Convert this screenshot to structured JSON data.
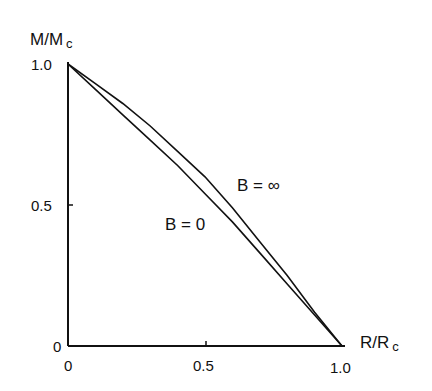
{
  "chart_data": {
    "type": "line",
    "title": "",
    "xlabel": "R/R",
    "xlabel_subscript": "c",
    "ylabel": "M/M",
    "ylabel_subscript": "c",
    "xlim": [
      0,
      1.0
    ],
    "ylim": [
      0,
      1.0
    ],
    "x_ticks": [
      "0",
      "0.5",
      "1.0"
    ],
    "y_ticks": [
      "0",
      "0.5",
      "1.0"
    ],
    "grid": false,
    "legend": "inline annotations",
    "series": [
      {
        "name": "B = ∞",
        "x": [
          0,
          0.1,
          0.2,
          0.3,
          0.4,
          0.5,
          0.6,
          0.7,
          0.8,
          0.9,
          1.0
        ],
        "y": [
          1.0,
          0.93,
          0.86,
          0.78,
          0.69,
          0.6,
          0.49,
          0.37,
          0.25,
          0.12,
          0
        ]
      },
      {
        "name": "B = 0",
        "x": [
          0,
          0.1,
          0.2,
          0.3,
          0.4,
          0.5,
          0.6,
          0.7,
          0.8,
          0.9,
          1.0
        ],
        "y": [
          1.0,
          0.91,
          0.82,
          0.73,
          0.64,
          0.54,
          0.44,
          0.33,
          0.22,
          0.11,
          0
        ]
      }
    ],
    "annotations": [
      {
        "text": "B = ∞",
        "x": 0.62,
        "y": 0.56
      },
      {
        "text": "B = 0",
        "x": 0.36,
        "y": 0.42
      }
    ]
  },
  "labels": {
    "y_axis": "M/M",
    "y_axis_sub": "c",
    "x_axis": "R/R",
    "x_axis_sub": "c",
    "y_tick_1": "1.0",
    "y_tick_05": "0.5",
    "y_tick_0": "0",
    "x_tick_0": "0",
    "x_tick_05": "0.5",
    "x_tick_1": "1.0",
    "ann_binf": "B  =  ∞",
    "ann_b0": "B = 0"
  }
}
